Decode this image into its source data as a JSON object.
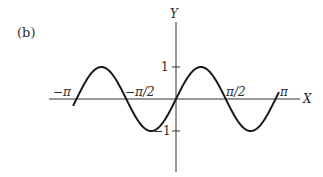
{
  "panel_label": "(b)",
  "axes": {
    "x_label": "X",
    "y_label": "Y",
    "x_ticks": [
      {
        "value": -3.14159,
        "label": "−π"
      },
      {
        "value": -1.5708,
        "label": "−π/2"
      },
      {
        "value": 1.5708,
        "label": "π/2"
      },
      {
        "value": 3.14159,
        "label": "π"
      }
    ],
    "y_ticks": [
      {
        "value": 1,
        "label": "1"
      },
      {
        "value": -1,
        "label": "−1"
      }
    ]
  },
  "colors": {
    "curve": "#1a1a1a",
    "axis": "#333333",
    "text": "#2b2b2b"
  },
  "chart_data": {
    "type": "line",
    "title": "",
    "panel": "(b)",
    "function": "y = sin(2x)",
    "xlabel": "X",
    "ylabel": "Y",
    "xlim": [
      -3.25,
      3.25
    ],
    "ylim": [
      -1,
      1
    ],
    "grid": false,
    "legend": null,
    "x_tick_labels": [
      "−π",
      "−π/2",
      "π/2",
      "π"
    ],
    "y_tick_labels": [
      "1",
      "−1"
    ],
    "series": [
      {
        "name": "sin(2x)",
        "x": [
          -3.25,
          -3.14159,
          -2.35619,
          -1.5708,
          -0.7854,
          0,
          0.7854,
          1.5708,
          2.35619,
          3.14159,
          3.25
        ],
        "values": [
          -0.215,
          0,
          1,
          0,
          -1,
          0,
          1,
          0,
          -1,
          0,
          0.215
        ]
      }
    ]
  }
}
